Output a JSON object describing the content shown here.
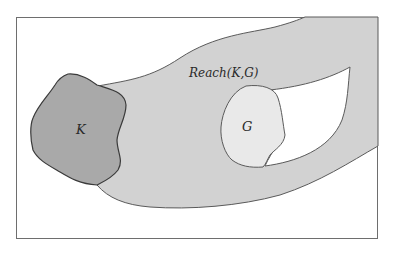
{
  "diagram": {
    "type": "set-diagram",
    "frame": {
      "x": 16,
      "y": 17,
      "width": 362,
      "height": 222,
      "stroke": "#6e6e6e",
      "fill": "#ffffff"
    },
    "regions": [
      {
        "id": "reach",
        "label": "Reach(K,G)",
        "fill": "#d2d2d2",
        "description": "Reachable region from K to G, a curved band"
      },
      {
        "id": "K",
        "label": "K",
        "fill": "#a9a9a9",
        "description": "Start set K"
      },
      {
        "id": "G",
        "label": "G",
        "fill": "#e9e9e9",
        "description": "Goal set G"
      },
      {
        "id": "hole",
        "label": "",
        "fill": "#ffffff",
        "description": "Unreached pocket inside the band near G"
      }
    ],
    "colors": {
      "outline": "#5a5a5a",
      "k_outline": "#3a3a3a",
      "text": "#2a2a2a"
    }
  }
}
